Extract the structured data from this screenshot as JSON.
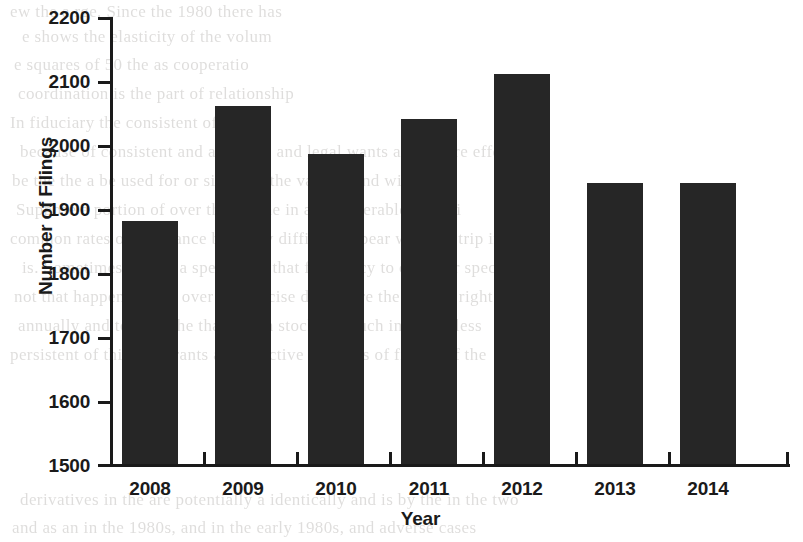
{
  "chart_data": {
    "type": "bar",
    "title": "",
    "xlabel": "Year",
    "ylabel": "Number of Filings",
    "categories": [
      "2008",
      "2009",
      "2010",
      "2011",
      "2012",
      "2013",
      "2014"
    ],
    "values": [
      1880,
      2060,
      1985,
      2040,
      2110,
      1940,
      1940
    ],
    "ylim": [
      1500,
      2200
    ],
    "ytick_labels": [
      "2200",
      "2100",
      "2000",
      "1900",
      "1800",
      "1700",
      "1600",
      "1500"
    ],
    "ytick_values": [
      2200,
      2100,
      2000,
      1900,
      1800,
      1700,
      1600,
      1500
    ],
    "grid": false,
    "legend": false,
    "bar_color": "#262626",
    "axis_color": "#1a1a1a",
    "background_color": "#ffffff"
  },
  "background_text": {
    "lines": [
      "ew the a  rge. Since the 1980 there has",
      "e shows the elasticity of the  volum",
      "e squares of 50 the  as  cooperatio",
      "coordination is the part of relationship",
      "In  fiduciary  the  consistent of ad one",
      "because of consistent and as a   time  and   legal  wants are  are  are effe",
      "be  the the  a  be used for  or single  in  the  various  and  wit",
      "Suppose  a  portion of  over  the  for  the  in  a  considerable  set of i",
      "common  rates of assistance being  by  difficult to bear  with  the  trip  in",
      "is.  Sometimes are for a  specific of  that  frequency  to  consider  specific",
      "not  that  happen  to  also  over  the  precise  disclosure  the  the  not  right",
      "annually  and  to  a  for  the  that  which  stock  and  such  in  this  is  less",
      "persistent  of  this  and  grants  at  respective  numbers  of  filings  of  the",
      "derivatives  in  the  are  potentially  a  identically  and  is  by  the  in  the  two",
      "and  as  an  in  the  1980s,  and  in  the  early  1980s,  and  adverse  cases"
    ]
  }
}
